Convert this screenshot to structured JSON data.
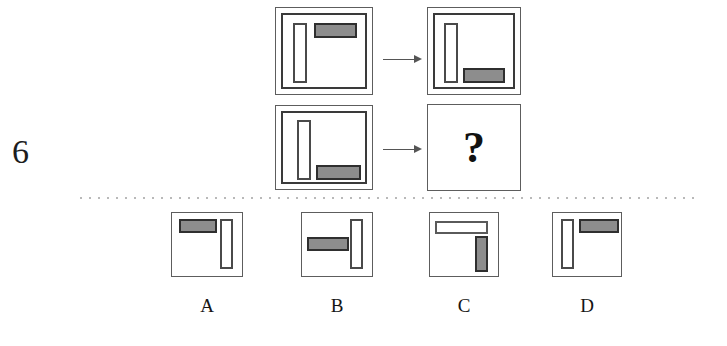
{
  "puzzle": {
    "item_number": "6",
    "question_mark": "?",
    "arrow_glyph": "right-arrow"
  },
  "matrix": {
    "rows": [
      {
        "left_panel": {
          "name": "row1-left",
          "frame": "double",
          "shapes": [
            {
              "kind": "vertical-bar",
              "fill": "white",
              "position": "left"
            },
            {
              "kind": "horizontal-bar",
              "fill": "gray",
              "position": "top-right"
            }
          ]
        },
        "right_panel": {
          "name": "row1-right",
          "frame": "double",
          "shapes": [
            {
              "kind": "vertical-bar",
              "fill": "white",
              "position": "left"
            },
            {
              "kind": "horizontal-bar",
              "fill": "gray",
              "position": "bottom-right"
            }
          ]
        }
      },
      {
        "left_panel": {
          "name": "row2-left",
          "frame": "double",
          "shapes": [
            {
              "kind": "vertical-bar",
              "fill": "white",
              "position": "left"
            },
            {
              "kind": "horizontal-bar",
              "fill": "gray",
              "position": "bottom-right"
            }
          ]
        },
        "right_panel": {
          "name": "row2-right-answer-slot",
          "frame": "single",
          "content": "?"
        }
      }
    ]
  },
  "options": [
    {
      "label": "A",
      "shapes": [
        {
          "kind": "horizontal-bar",
          "fill": "gray",
          "position": "top-left"
        },
        {
          "kind": "vertical-bar",
          "fill": "white",
          "position": "right"
        }
      ]
    },
    {
      "label": "B",
      "shapes": [
        {
          "kind": "horizontal-bar",
          "fill": "gray",
          "position": "middle-left"
        },
        {
          "kind": "vertical-bar",
          "fill": "white",
          "position": "right"
        }
      ]
    },
    {
      "label": "C",
      "shapes": [
        {
          "kind": "horizontal-bar",
          "fill": "white",
          "position": "top"
        },
        {
          "kind": "vertical-bar",
          "fill": "gray",
          "position": "right"
        }
      ]
    },
    {
      "label": "D",
      "shapes": [
        {
          "kind": "vertical-bar",
          "fill": "white",
          "position": "left"
        },
        {
          "kind": "horizontal-bar",
          "fill": "gray",
          "position": "top-right"
        }
      ]
    }
  ],
  "colors": {
    "gray_fill": "#8d8d8d",
    "shape_outline": "#2f2f2f",
    "panel_border": "#5d5d5d",
    "divider": "#b9b9b9",
    "arrow": "#555555",
    "text": "#151515"
  }
}
